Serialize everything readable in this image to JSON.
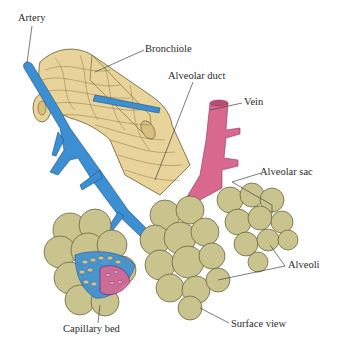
{
  "diagram": {
    "colors": {
      "bronchiole": "#e8d49a",
      "bronchiole_stroke": "#6b5a2e",
      "artery": "#3d8fd4",
      "vein": "#d9688e",
      "alveoli": "#c9c48e",
      "alveoli_stroke": "#5b5834",
      "leader_line": "#444444",
      "background": "#ffffff"
    },
    "labels": {
      "artery": "Artery",
      "bronchiole": "Bronchiole",
      "alveolar_duct": "Alveolar duct",
      "vein": "Vein",
      "alveolar_sac": "Alveolar sac",
      "alveoli": "Alveoli",
      "capillary_bed": "Capillary bed",
      "surface_view": "Surface view"
    }
  }
}
